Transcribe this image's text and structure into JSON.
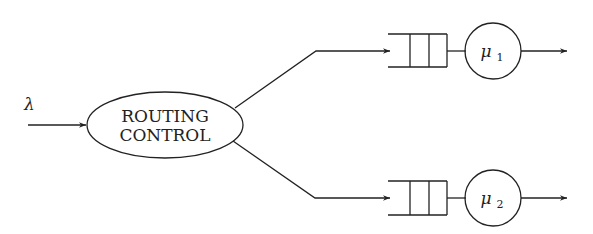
{
  "diagram": {
    "type": "queueing-routing",
    "input": {
      "label": "λ"
    },
    "router": {
      "line1": "ROUTING",
      "line2": "CONTROL"
    },
    "servers": [
      {
        "label": "μ",
        "subscript": "1"
      },
      {
        "label": "μ",
        "subscript": "2"
      }
    ],
    "colors": {
      "stroke": "#222222",
      "background": "#ffffff"
    }
  }
}
